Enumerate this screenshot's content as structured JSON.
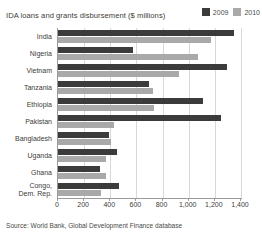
{
  "header": {
    "title": "IDA loans and grants disbursement ($ millions)"
  },
  "legend": {
    "items": [
      {
        "label": "2009",
        "color": "#3b3b3b",
        "icon": "legend-swatch"
      },
      {
        "label": "2010",
        "color": "#a9a9a9",
        "icon": "legend-swatch"
      }
    ]
  },
  "source": {
    "text": "Source: World Bank, Global Development Finance database"
  },
  "chart_data": {
    "type": "bar",
    "orientation": "horizontal",
    "title": "IDA loans and grants disbursement ($ millions)",
    "xlabel": "",
    "ylabel": "",
    "xlim": [
      0,
      1400
    ],
    "xticks": [
      0,
      200,
      400,
      600,
      800,
      1000,
      1200,
      1400
    ],
    "xticklabels": [
      "0",
      "200",
      "400",
      "600",
      "800",
      "1,000",
      "1,200",
      "1,400"
    ],
    "grid": true,
    "legend_position": "top-right",
    "categories": [
      "India",
      "Nigeria",
      "Vietnam",
      "Tanzania",
      "Ethiopia",
      "Pakistan",
      "Bangladesh",
      "Uganda",
      "Ghana",
      "Congo,\nDem. Rep."
    ],
    "series": [
      {
        "name": "2009",
        "color": "#3b3b3b",
        "values": [
          1350,
          570,
          1290,
          695,
          1110,
          1250,
          390,
          450,
          320,
          465
        ]
      },
      {
        "name": "2010",
        "color": "#a9a9a9",
        "values": [
          1170,
          1070,
          925,
          730,
          735,
          430,
          405,
          370,
          370,
          330
        ]
      }
    ]
  }
}
